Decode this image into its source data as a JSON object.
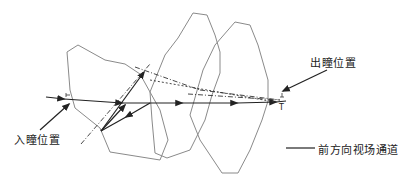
{
  "diagram": {
    "labels": {
      "entrance_pupil": "入瞳位置",
      "exit_pupil": "出瞳位置",
      "legend": "前方向视场通道",
      "exit_marker": "T"
    },
    "colors": {
      "lens_outline": "#8a8a8a",
      "ray": "#222222",
      "text": "#222222"
    }
  }
}
